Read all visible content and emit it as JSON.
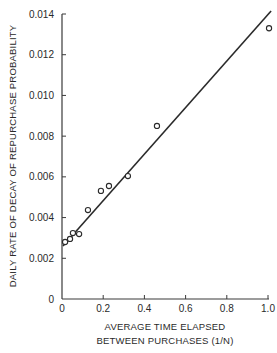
{
  "chart_data": {
    "type": "scatter",
    "title": "",
    "xlabel": "AVERAGE TIME ELAPSED BETWEEN PURCHASES (1/N)",
    "xlabel_lines": [
      "AVERAGE TIME ELAPSED",
      "BETWEEN PURCHASES (1/N)"
    ],
    "ylabel": "DAILY RATE OF DECAY OF REPURCHASE PROBABILITY",
    "xlim": [
      0,
      1.0
    ],
    "ylim": [
      0,
      0.014
    ],
    "x_ticks": [
      "0",
      "0.2",
      "0.4",
      "0.6",
      "0.8",
      "1.0"
    ],
    "y_ticks": [
      "0",
      "0.002",
      "0.004",
      "0.006",
      "0.008",
      "0.010",
      "0.012",
      "0.014"
    ],
    "grid": false,
    "legend": null,
    "series": [
      {
        "name": "observed",
        "marker": "open-circle",
        "points": [
          {
            "x": 0.015,
            "y": 0.0028
          },
          {
            "x": 0.039,
            "y": 0.00295
          },
          {
            "x": 0.053,
            "y": 0.00324
          },
          {
            "x": 0.083,
            "y": 0.00319
          },
          {
            "x": 0.126,
            "y": 0.00437
          },
          {
            "x": 0.189,
            "y": 0.00531
          },
          {
            "x": 0.228,
            "y": 0.00555
          },
          {
            "x": 0.32,
            "y": 0.00604
          },
          {
            "x": 0.461,
            "y": 0.0085
          },
          {
            "x": 1.005,
            "y": 0.0133
          }
        ]
      },
      {
        "name": "fitted line",
        "type": "line",
        "points": [
          {
            "x": 0.005,
            "y": 0.0026
          },
          {
            "x": 1.015,
            "y": 0.01415
          }
        ]
      }
    ]
  }
}
